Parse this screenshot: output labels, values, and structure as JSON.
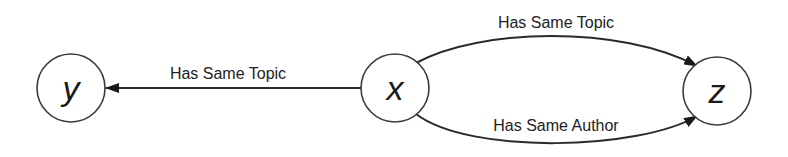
{
  "diagram": {
    "type": "directed-graph",
    "nodes": [
      {
        "id": "y",
        "label": "y"
      },
      {
        "id": "x",
        "label": "x"
      },
      {
        "id": "z",
        "label": "z"
      }
    ],
    "edges": [
      {
        "from": "x",
        "to": "y",
        "label": "Has Same Topic",
        "shape": "straight"
      },
      {
        "from": "x",
        "to": "z",
        "label": "Has Same Topic",
        "shape": "arc-top"
      },
      {
        "from": "x",
        "to": "z",
        "label": "Has Same Author",
        "shape": "arc-bottom"
      }
    ],
    "colors": {
      "stroke": "#2a2a2a",
      "node_fill": "#ffffff",
      "text": "#1a1a1a",
      "background": "#ffffff"
    }
  }
}
